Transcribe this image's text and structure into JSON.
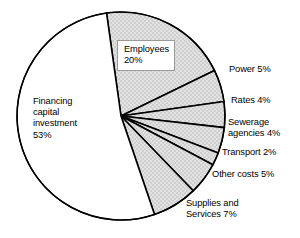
{
  "chart_data": {
    "type": "pie",
    "title": "",
    "subtitle": "",
    "xlabel": "",
    "ylabel": "",
    "legend_position": "none",
    "grid": false,
    "units": "percent",
    "total": 100,
    "start_angle_deg": -98,
    "direction": "clockwise",
    "categories": [
      "Employees",
      "Power",
      "Rates",
      "Sewerage agencies",
      "Transport",
      "Other costs",
      "Supplies and Services",
      "Financing capital investment"
    ],
    "values": [
      20,
      5,
      4,
      4,
      2,
      5,
      7,
      53
    ],
    "slices": [
      {
        "name": "Employees",
        "label_lines": [
          "Employees",
          "20%"
        ],
        "value": 20,
        "fill": "hatched",
        "fill_color": "#d9d9d9"
      },
      {
        "name": "Power",
        "label_lines": [
          "Power 5%"
        ],
        "value": 5,
        "fill": "hatched",
        "fill_color": "#d9d9d9"
      },
      {
        "name": "Rates",
        "label_lines": [
          "Rates 4%"
        ],
        "value": 4,
        "fill": "hatched",
        "fill_color": "#d9d9d9"
      },
      {
        "name": "Sewerage agencies",
        "label_lines": [
          "Sewerage",
          "agencies 4%"
        ],
        "value": 4,
        "fill": "hatched",
        "fill_color": "#d9d9d9"
      },
      {
        "name": "Transport",
        "label_lines": [
          "Transport 2%"
        ],
        "value": 2,
        "fill": "hatched",
        "fill_color": "#d9d9d9"
      },
      {
        "name": "Other costs",
        "label_lines": [
          "Other costs 5%"
        ],
        "value": 5,
        "fill": "hatched",
        "fill_color": "#d9d9d9"
      },
      {
        "name": "Supplies and Services",
        "label_lines": [
          "Supplies and",
          "Services 7%"
        ],
        "value": 7,
        "fill": "hatched",
        "fill_color": "#d9d9d9"
      },
      {
        "name": "Financing capital investment",
        "label_lines": [
          "Financing",
          "capital",
          "investment",
          "53%"
        ],
        "value": 53,
        "fill": "solid",
        "fill_color": "#ffffff"
      }
    ],
    "geometry": {
      "center_x": 121,
      "center_y": 116,
      "radius": 104
    },
    "style": {
      "stroke_color": "#000000",
      "stroke_width": 1.6,
      "outline_width": 1.2,
      "hatch_color": "#b9b9b9",
      "background": "#ffffff"
    }
  },
  "labels": {
    "financing": "Financing\ncapital\ninvestment\n53%",
    "employees": "Employees\n20%",
    "power": "Power 5%",
    "rates": "Rates 4%",
    "sewerage": "Sewerage\nagencies 4%",
    "transport": "Transport 2%",
    "other_costs": "Other costs 5%",
    "supplies": "Supplies and\nServices 7%"
  }
}
